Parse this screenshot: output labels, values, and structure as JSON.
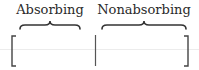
{
  "diagram": {
    "type": "block-matrix-partition",
    "labels": [
      {
        "id": "absorbing",
        "text": "Absorbing",
        "center_x": 50
      },
      {
        "id": "nonabsorbing",
        "text": "Nonabsorbing",
        "center_x": 144
      }
    ],
    "braces": [
      {
        "id": "absorbing-brace",
        "x1": 20,
        "x2": 80,
        "direction": "up"
      },
      {
        "id": "nonabsorbing-brace",
        "x1": 102,
        "x2": 186,
        "direction": "up"
      }
    ],
    "matrix": {
      "left_bracket_x": 12,
      "divider_x": 95,
      "right_bracket_x": 188,
      "top_y": 36,
      "bottom_y": 66
    },
    "colors": {
      "ink": "#333333",
      "faint_line": "#ececec",
      "background": "#ffffff"
    }
  }
}
